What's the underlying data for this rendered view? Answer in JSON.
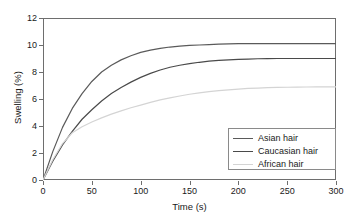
{
  "chart_data": {
    "type": "line",
    "title": "",
    "xlabel": "Time (s)",
    "ylabel": "Swelling (%)",
    "xlim": [
      0,
      300
    ],
    "ylim": [
      0,
      12
    ],
    "xticks": [
      0,
      50,
      100,
      150,
      200,
      250,
      300
    ],
    "yticks": [
      0,
      2,
      4,
      6,
      8,
      10,
      12
    ],
    "grid": false,
    "legend_position": "lower-right",
    "x": [
      0,
      10,
      20,
      30,
      40,
      50,
      60,
      70,
      80,
      90,
      100,
      110,
      120,
      130,
      140,
      150,
      160,
      170,
      180,
      190,
      200,
      210,
      220,
      230,
      240,
      250,
      260,
      270,
      280,
      290,
      300
    ],
    "series": [
      {
        "name": "Asian hair",
        "color": "#5a5a5a",
        "plateau": 10.1,
        "values": [
          0,
          2.1,
          3.9,
          5.3,
          6.4,
          7.3,
          8.0,
          8.5,
          8.9,
          9.2,
          9.45,
          9.62,
          9.75,
          9.85,
          9.92,
          9.97,
          10.0,
          10.03,
          10.06,
          10.08,
          10.1,
          10.1,
          10.1,
          10.1,
          10.1,
          10.1,
          10.1,
          10.1,
          10.1,
          10.1,
          10.1
        ]
      },
      {
        "name": "Caucasian hair",
        "color": "#4a4a4a",
        "plateau": 9.0,
        "values": [
          0,
          1.4,
          2.6,
          3.6,
          4.5,
          5.2,
          5.85,
          6.4,
          6.85,
          7.25,
          7.6,
          7.9,
          8.15,
          8.35,
          8.5,
          8.62,
          8.72,
          8.8,
          8.86,
          8.9,
          8.93,
          8.96,
          8.98,
          8.99,
          9.0,
          9.0,
          9.0,
          9.0,
          9.0,
          9.0,
          9.0
        ]
      },
      {
        "name": "African hair",
        "color": "#d4d4d4",
        "plateau": 6.9,
        "values": [
          0,
          1.5,
          2.7,
          3.5,
          3.95,
          4.3,
          4.6,
          4.88,
          5.12,
          5.35,
          5.55,
          5.75,
          5.93,
          6.08,
          6.22,
          6.35,
          6.46,
          6.55,
          6.62,
          6.68,
          6.73,
          6.78,
          6.81,
          6.84,
          6.86,
          6.87,
          6.88,
          6.89,
          6.9,
          6.9,
          6.9
        ]
      }
    ]
  }
}
